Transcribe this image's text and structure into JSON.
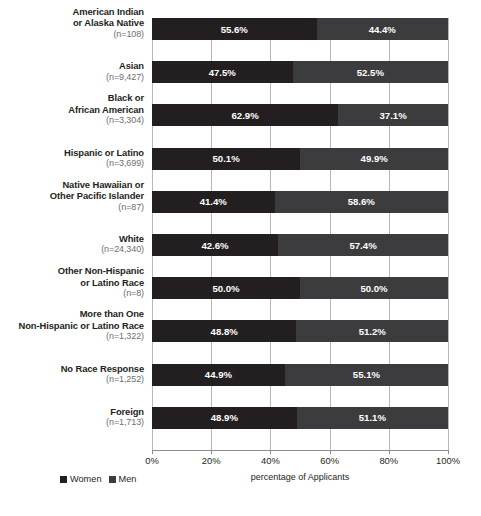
{
  "chart_data": {
    "type": "bar",
    "subtype": "stacked-horizontal-100pct",
    "title": "",
    "xlabel": "percentage of Applicants",
    "ylabel": "",
    "xlim": [
      0,
      100
    ],
    "grid": true,
    "legend_position": "bottom-left",
    "x_tick_labels": [
      "0%",
      "20%",
      "40%",
      "60%",
      "80%",
      "100%"
    ],
    "x_ticks": [
      0,
      20,
      40,
      60,
      80,
      100
    ],
    "categories": [
      "American Indian or Alaska Native",
      "Asian",
      "Black or African American",
      "Hispanic or Latino",
      "Native Hawaiian or Other Pacific Islander",
      "White",
      "Other Non-Hispanic or Latino Race",
      "More than One Non-Hispanic or Latino Race",
      "No Race Response",
      "Foreign"
    ],
    "category_lines": [
      [
        "American Indian",
        "or Alaska Native"
      ],
      [
        "Asian"
      ],
      [
        "Black or",
        "African American"
      ],
      [
        "Hispanic or Latino"
      ],
      [
        "Native Hawaiian or",
        "Other Pacific Islander"
      ],
      [
        "White"
      ],
      [
        "Other Non-Hispanic",
        "or Latino Race"
      ],
      [
        "More than One",
        "Non-Hispanic or Latino Race"
      ],
      [
        "No Race Response"
      ],
      [
        "Foreign"
      ]
    ],
    "category_counts": [
      "(n=108)",
      "(n=9,427)",
      "(n=3,304)",
      "(n=3,699)",
      "(n=87)",
      "(n=24,340)",
      "(n=8)",
      "(n=1,322)",
      "(n=1,252)",
      "(n=1,713)"
    ],
    "series": [
      {
        "name": "Women",
        "color": "#231f20",
        "values": [
          55.6,
          47.5,
          62.9,
          50.1,
          41.4,
          42.6,
          50.0,
          48.8,
          44.9,
          48.9
        ],
        "labels": [
          "55.6%",
          "47.5%",
          "62.9%",
          "50.1%",
          "41.4%",
          "42.6%",
          "50.0%",
          "48.8%",
          "44.9%",
          "48.9%"
        ]
      },
      {
        "name": "Men",
        "color": "#3c3c3e",
        "values": [
          44.4,
          52.5,
          37.1,
          49.9,
          58.6,
          57.4,
          50.0,
          51.2,
          55.1,
          51.1
        ],
        "labels": [
          "44.4%",
          "52.5%",
          "37.1%",
          "49.9%",
          "58.6%",
          "57.4%",
          "50.0%",
          "51.2%",
          "55.1%",
          "51.1%"
        ]
      }
    ]
  },
  "legend": {
    "items": [
      {
        "label": "Women",
        "color": "#231f20"
      },
      {
        "label": "Men",
        "color": "#3c3c3e"
      }
    ]
  },
  "axis": {
    "title": "percentage of Applicants"
  },
  "clipped_top_text": ""
}
